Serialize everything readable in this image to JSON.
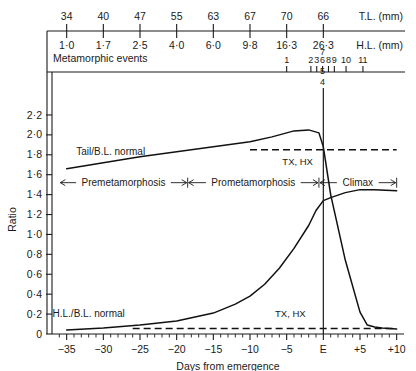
{
  "chart_data": {
    "type": "line",
    "title": "",
    "xlabel": "Days from emergence",
    "ylabel": "Ratio",
    "xlim": [
      -37,
      11
    ],
    "ylim": [
      0,
      2.3
    ],
    "x_tick_labels": [
      "−35",
      "−30",
      "−25",
      "−20",
      "−15",
      "−10",
      "−5",
      "E",
      "+5",
      "+10"
    ],
    "x_tick_values": [
      -35,
      -30,
      -25,
      -20,
      -15,
      -10,
      -5,
      0,
      5,
      10
    ],
    "y_tick_labels": [
      "0",
      "0·2",
      "0·4",
      "0·6",
      "0·8",
      "1·0",
      "1·2",
      "1·4",
      "1·6",
      "1·8",
      "2·0",
      "2·2"
    ],
    "y_tick_values": [
      0,
      0.2,
      0.4,
      0.6,
      0.8,
      1.0,
      1.2,
      1.4,
      1.6,
      1.8,
      2.0,
      2.2
    ],
    "grid": false,
    "legend_position": "inline-annotations",
    "series": [
      {
        "name": "Tail/B.L. normal",
        "label": "Tail/B.L. normal",
        "points": [
          [
            -35,
            1.66
          ],
          [
            -30,
            1.72
          ],
          [
            -25,
            1.78
          ],
          [
            -20,
            1.83
          ],
          [
            -15,
            1.88
          ],
          [
            -10,
            1.93
          ],
          [
            -7,
            1.98
          ],
          [
            -4,
            2.04
          ],
          [
            -2,
            2.05
          ],
          [
            -0.6,
            2.02
          ],
          [
            0,
            1.88
          ],
          [
            1,
            1.4
          ],
          [
            3,
            0.74
          ],
          [
            5,
            0.22
          ],
          [
            6,
            0.09
          ],
          [
            7,
            0.07
          ],
          [
            8,
            0.06
          ],
          [
            10,
            0.05
          ]
        ]
      },
      {
        "name": "H.L./B.L. normal",
        "label": "H.L./B.L. normal",
        "points": [
          [
            -35,
            0.04
          ],
          [
            -30,
            0.06
          ],
          [
            -25,
            0.09
          ],
          [
            -20,
            0.13
          ],
          [
            -15,
            0.21
          ],
          [
            -12,
            0.3
          ],
          [
            -10,
            0.38
          ],
          [
            -8,
            0.5
          ],
          [
            -6,
            0.66
          ],
          [
            -4,
            0.86
          ],
          [
            -2,
            1.09
          ],
          [
            -1,
            1.24
          ],
          [
            0,
            1.34
          ],
          [
            1,
            1.37
          ],
          [
            3,
            1.42
          ],
          [
            5,
            1.45
          ],
          [
            7,
            1.45
          ],
          [
            10,
            1.44
          ]
        ]
      },
      {
        "name": "Tail/B.L. TX, HX",
        "label": "TX, HX",
        "style": "dashed",
        "points": [
          [
            -10,
            1.85
          ],
          [
            10,
            1.85
          ]
        ]
      },
      {
        "name": "H.L./B.L. TX, HX",
        "label": "TX, HX",
        "style": "dashed",
        "points": [
          [
            -26,
            0.055
          ],
          [
            10,
            0.055
          ]
        ]
      }
    ],
    "annotations": [
      {
        "text": "Tail/B.L. normal",
        "x": -29,
        "y": 1.8
      },
      {
        "text": "TX, HX",
        "x": -3.5,
        "y": 1.7
      },
      {
        "text": "H.L./B.L. normal",
        "x": -32,
        "y": 0.175
      },
      {
        "text": "TX, HX",
        "x": -4.5,
        "y": 0.175
      },
      {
        "text": "E",
        "x": 0,
        "y": 0,
        "note": "emergence vertical reference line"
      }
    ],
    "phases": [
      {
        "label": "Premetamorphosis",
        "start": -36,
        "end": -18.5
      },
      {
        "label": "Prometamorphosis",
        "start": -18.5,
        "end": -0.6
      },
      {
        "label": "Climax",
        "start": -0.6,
        "end": 10
      }
    ],
    "phase_band_y": 1.52
  },
  "header": {
    "tl_row": {
      "label": "T.L. (mm)",
      "name": "total-length",
      "values": [
        "34",
        "40",
        "47",
        "55",
        "63",
        "67",
        "70",
        "66"
      ],
      "at_days": [
        -35,
        -30,
        -25,
        -20,
        -15,
        -10,
        -5,
        0
      ]
    },
    "hl_row": {
      "label": "H.L. (mm)",
      "name": "hind-limb-length",
      "values": [
        "1·0",
        "1·7",
        "2·5",
        "4·0",
        "6·0",
        "9·8",
        "16·3",
        "26·3"
      ],
      "at_days": [
        -35,
        -30,
        -25,
        -20,
        -15,
        -10,
        -5,
        0
      ]
    },
    "events_row": {
      "label": "Metamorphic events",
      "markers": [
        {
          "num": "1",
          "day": -5.0,
          "tier": 0
        },
        {
          "num": "2",
          "day": -1.7,
          "tier": 0
        },
        {
          "num": "3",
          "day": -0.9,
          "tier": 0
        },
        {
          "num": "6",
          "day": -0.1,
          "tier": 0
        },
        {
          "num": "8",
          "day": 0.7,
          "tier": 0
        },
        {
          "num": "9",
          "day": 1.5,
          "tier": 0
        },
        {
          "num": "10",
          "day": 3.1,
          "tier": 0
        },
        {
          "num": "11",
          "day": 5.4,
          "tier": 0
        },
        {
          "num": "7",
          "day": -0.1,
          "tier": -1
        },
        {
          "num": "5",
          "day": -0.1,
          "tier": 1
        },
        {
          "num": "4",
          "day": -0.1,
          "tier": 2
        }
      ]
    }
  },
  "axis_titles": {
    "x": "Days from emergence",
    "y": "Ratio"
  }
}
